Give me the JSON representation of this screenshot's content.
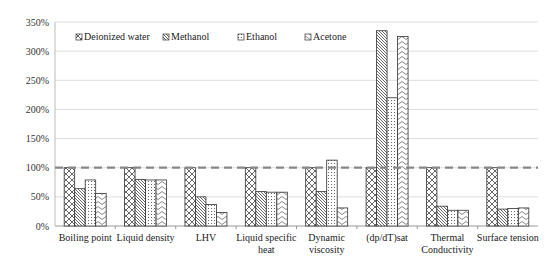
{
  "chart_data": {
    "type": "bar",
    "title": "",
    "xlabel": "",
    "ylabel": "",
    "ylim": [
      0,
      350
    ],
    "y_ticks": [
      "0%",
      "50%",
      "100%",
      "150%",
      "200%",
      "250%",
      "300%",
      "350%"
    ],
    "grid": true,
    "legend_position": "top-inside",
    "reference_line": {
      "value": 100,
      "style": "dashed",
      "color": "#888888"
    },
    "categories": [
      "Boiling point",
      "Liquid density",
      "LHV",
      "Liquid specific heat",
      "Dynamic viscosity",
      "(dp/dT)sat",
      "Thermal Conductivity",
      "Surface tension"
    ],
    "category_lines": [
      [
        "Boiling point"
      ],
      [
        "Liquid density"
      ],
      [
        "LHV"
      ],
      [
        "Liquid specific",
        "heat"
      ],
      [
        "Dynamic",
        "viscosity"
      ],
      [
        "(dp/dT)sat"
      ],
      [
        "Thermal",
        "Conductivity"
      ],
      [
        "Surface tension"
      ]
    ],
    "series": [
      {
        "name": "Deionized water",
        "pattern": "crosshatch",
        "values": [
          100,
          100,
          100,
          100,
          100,
          100,
          100,
          100
        ]
      },
      {
        "name": "Methanol",
        "pattern": "diagonal",
        "values": [
          64,
          80,
          50,
          59,
          59,
          335,
          34,
          29
        ]
      },
      {
        "name": "Ethanol",
        "pattern": "dots",
        "values": [
          79,
          79,
          37,
          58,
          113,
          220,
          27,
          30
        ]
      },
      {
        "name": "Acetone",
        "pattern": "waves",
        "values": [
          56,
          79,
          23,
          58,
          31,
          325,
          27,
          31
        ]
      }
    ]
  }
}
